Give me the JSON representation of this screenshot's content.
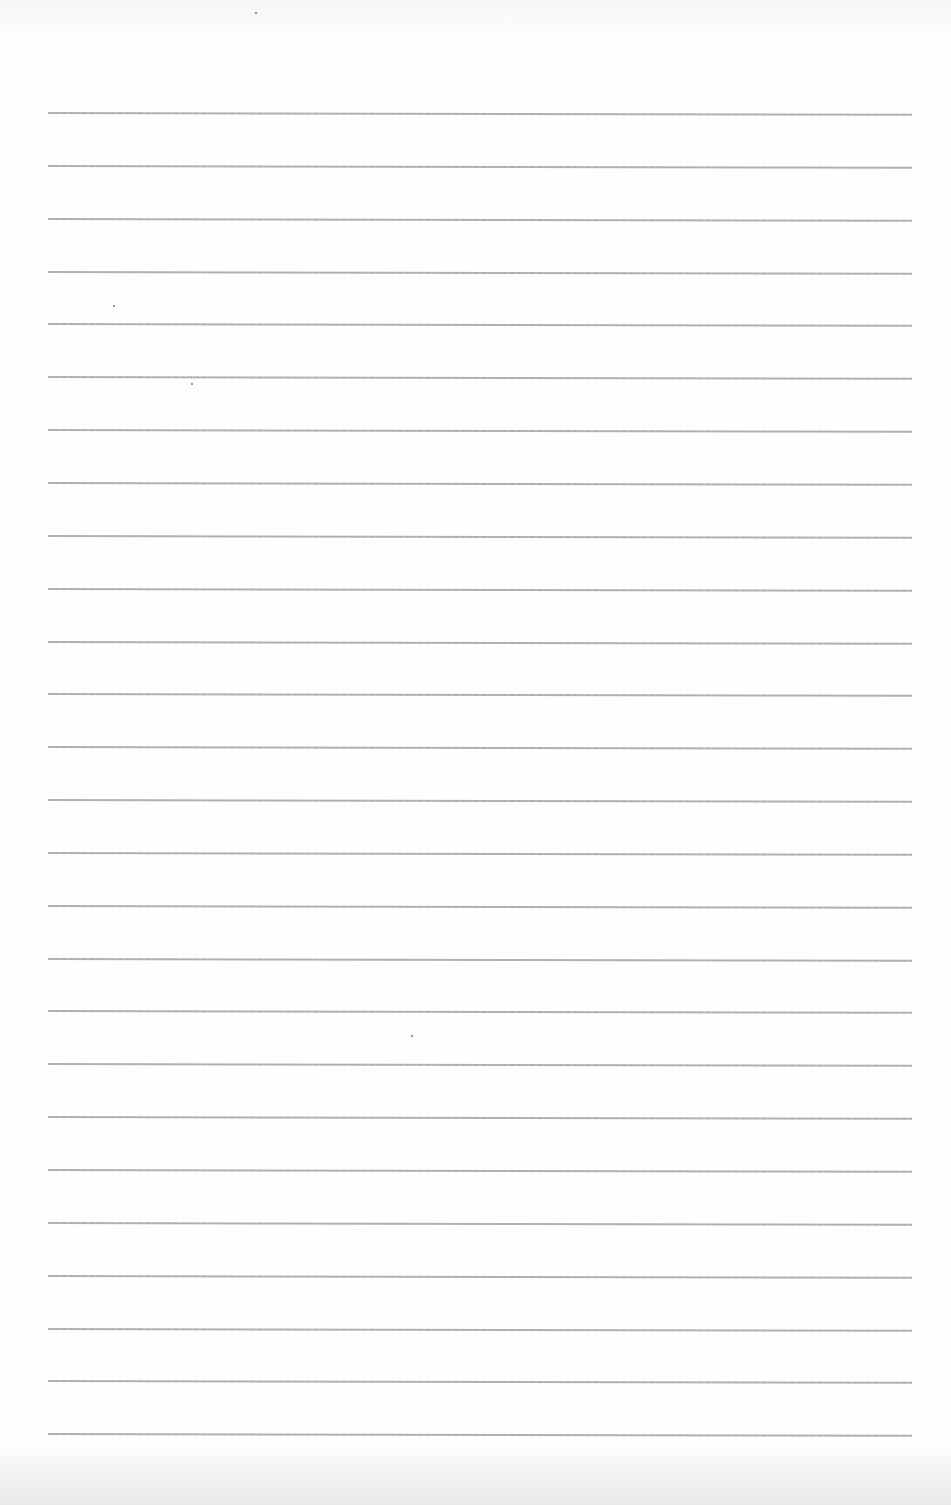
{
  "page": {
    "type": "blank lined paper",
    "background_color": "#fdfdfd",
    "rule_color": "#9c9c9c",
    "rule_count": 26,
    "rule_left": 48,
    "rule_width": 864,
    "first_rule_y": 112,
    "rule_spacing": 52.85,
    "text": ""
  },
  "specks": [
    {
      "x": 255,
      "y": 12
    },
    {
      "x": 113,
      "y": 305
    },
    {
      "x": 191,
      "y": 383
    },
    {
      "x": 411,
      "y": 1035
    }
  ]
}
